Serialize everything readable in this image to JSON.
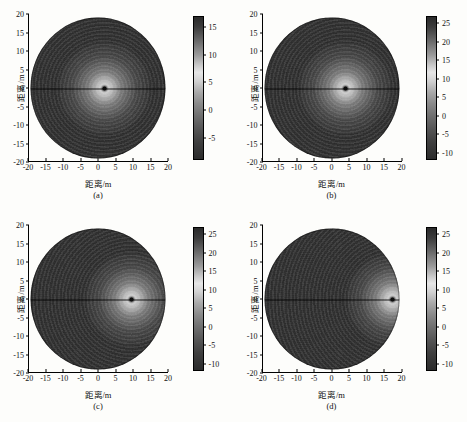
{
  "figure": {
    "background_color": "#fdfdfb",
    "colormap": "grayscale",
    "axis_label_x": "距离/m",
    "axis_label_y": "距离/m",
    "xticks": [
      -20,
      -15,
      -10,
      -5,
      0,
      5,
      10,
      15,
      20
    ],
    "yticks": [
      20,
      15,
      10,
      5,
      0,
      -5,
      -10,
      -15,
      -20
    ],
    "xlim": [
      -20,
      20
    ],
    "ylim": [
      -20,
      20
    ]
  },
  "chart_data": [
    {
      "type": "heatmap",
      "panel": "(a)",
      "title": "",
      "xlabel": "距离/m",
      "ylabel": "距离/m",
      "xlim": [
        -20,
        20
      ],
      "ylim": [
        -20,
        20
      ],
      "xticks": [
        -20,
        -15,
        -10,
        -5,
        0,
        5,
        10,
        15,
        20
      ],
      "yticks": [
        20,
        15,
        10,
        5,
        0,
        -5,
        -10,
        -15,
        -20
      ],
      "grid": false,
      "legend": "none",
      "colorbar": {
        "ticks": [
          15,
          10,
          5,
          0,
          -5
        ],
        "vmin": -9,
        "vmax": 17,
        "colormap": "gray"
      },
      "target_point": {
        "x": 2,
        "y": 0,
        "peak_value": 17
      },
      "description": "Circular polar image, bright focused spot near origin"
    },
    {
      "type": "heatmap",
      "panel": "(b)",
      "title": "",
      "xlabel": "距离/m",
      "ylabel": "距离/m",
      "xlim": [
        -20,
        20
      ],
      "ylim": [
        -20,
        20
      ],
      "xticks": [
        -20,
        -15,
        -10,
        -5,
        0,
        5,
        10,
        15,
        20
      ],
      "yticks": [
        20,
        15,
        10,
        5,
        0,
        -5,
        -10,
        -15,
        -20
      ],
      "grid": false,
      "legend": "none",
      "colorbar": {
        "ticks": [
          25,
          20,
          15,
          10,
          5,
          0,
          -5,
          -10
        ],
        "vmin": -12,
        "vmax": 27,
        "colormap": "gray"
      },
      "target_point": {
        "x": 4,
        "y": 0,
        "peak_value": 27
      },
      "description": "Circular polar image, bright focused spot offset right of origin"
    },
    {
      "type": "heatmap",
      "panel": "(c)",
      "title": "",
      "xlabel": "距离/m",
      "ylabel": "距离/m",
      "xlim": [
        -20,
        20
      ],
      "ylim": [
        -20,
        20
      ],
      "xticks": [
        -20,
        -15,
        -10,
        -5,
        0,
        5,
        10,
        15,
        20
      ],
      "yticks": [
        20,
        15,
        10,
        5,
        0,
        -5,
        -10,
        -15,
        -20
      ],
      "grid": false,
      "legend": "none",
      "colorbar": {
        "ticks": [
          25,
          20,
          15,
          10,
          5,
          0,
          -5,
          -10
        ],
        "vmin": -12,
        "vmax": 27,
        "colormap": "gray"
      },
      "target_point": {
        "x": 10,
        "y": 0,
        "peak_value": 27
      },
      "description": "Circular polar image, bright focused spot at x = 10 m"
    },
    {
      "type": "heatmap",
      "panel": "(d)",
      "title": "",
      "xlabel": "距离/m",
      "ylabel": "距离/m",
      "xlim": [
        -20,
        20
      ],
      "ylim": [
        -20,
        20
      ],
      "xticks": [
        -20,
        -15,
        -10,
        -5,
        0,
        5,
        10,
        15,
        20
      ],
      "yticks": [
        20,
        15,
        10,
        5,
        0,
        -5,
        -10,
        -15,
        -20
      ],
      "grid": false,
      "legend": "none",
      "colorbar": {
        "ticks": [
          25,
          20,
          15,
          10,
          5,
          0,
          -5,
          -10
        ],
        "vmin": -12,
        "vmax": 27,
        "colormap": "gray"
      },
      "target_point": {
        "x": 18,
        "y": 0,
        "peak_value": 27
      },
      "description": "Circular polar image, bright focused spot near right edge at x = 18 m"
    }
  ]
}
